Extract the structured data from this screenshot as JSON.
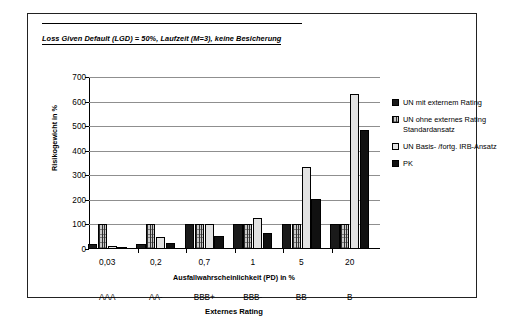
{
  "title": {
    "text": "Loss Given Default (LGD) = 50%, Laufzeit (M=3), keine Besicherung"
  },
  "legend": {
    "position": "right",
    "items": [
      {
        "label": "UN mit externem Rating",
        "swatch": "solid-black",
        "color": "#1a1a1a"
      },
      {
        "label": "UN ohne externes Rating Standardansatz",
        "swatch": "cross-hatch-gray",
        "color": "#c9c9c9"
      },
      {
        "label": "UN Basis- /fortg. IRB-Ansatz",
        "swatch": "light-gray-outline",
        "color": "#e2e2e2"
      },
      {
        "label": "PK",
        "swatch": "solid-black",
        "color": "#111111"
      }
    ]
  },
  "chart_data": {
    "type": "bar",
    "title": "Loss Given Default (LGD) = 50%, Laufzeit (M=3), keine Besicherung",
    "xlabel": "Ausfallwahrscheinlichkeit (PD) in %",
    "ylabel": "Risikogewicht in %",
    "secondary_xlabel": "Externes Rating",
    "categories": [
      "0,03",
      "0,2",
      "0,7",
      "1",
      "5",
      "20"
    ],
    "secondary_categories": [
      "AAA",
      "AA-",
      "BBB+",
      "BBB-",
      "BB",
      "B"
    ],
    "series": [
      {
        "name": "UN mit externem Rating",
        "values": [
          20,
          20,
          100,
          100,
          100,
          100
        ]
      },
      {
        "name": "UN ohne externes Rating Standardansatz",
        "values": [
          100,
          100,
          100,
          100,
          100,
          100
        ]
      },
      {
        "name": "UN Basis- /fortg. IRB-Ansatz",
        "values": [
          14,
          47,
          100,
          127,
          333,
          630
        ]
      },
      {
        "name": "PK",
        "values": [
          7,
          23,
          53,
          66,
          203,
          485
        ]
      }
    ],
    "ylim": [
      0,
      700
    ],
    "yticks": [
      0,
      100,
      200,
      300,
      400,
      500,
      600,
      700
    ],
    "ytick_labels": [
      "0",
      "100",
      "200",
      "300",
      "400",
      "500",
      "600",
      "700"
    ],
    "grid": true,
    "legend_position": "right"
  }
}
